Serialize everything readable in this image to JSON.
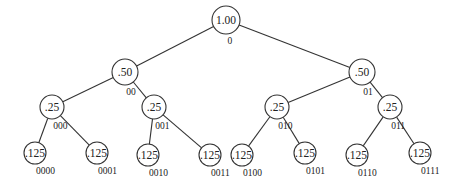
{
  "diagram": {
    "type": "binary-tree",
    "nodes": [
      {
        "id": "n",
        "value": "1.00",
        "code": "0",
        "x": 226,
        "y": 20,
        "r": 14
      },
      {
        "id": "n0",
        "value": ".50",
        "code": "00",
        "x": 125,
        "y": 72,
        "r": 13
      },
      {
        "id": "n1",
        "value": ".50",
        "code": "01",
        "x": 362,
        "y": 72,
        "r": 13
      },
      {
        "id": "n00",
        "value": ".25",
        "code": "000",
        "x": 52,
        "y": 107,
        "r": 12
      },
      {
        "id": "n01",
        "value": ".25",
        "code": "001",
        "x": 154,
        "y": 107,
        "r": 12
      },
      {
        "id": "n10",
        "value": ".25",
        "code": "010",
        "x": 277,
        "y": 107,
        "r": 12
      },
      {
        "id": "n11",
        "value": ".25",
        "code": "011",
        "x": 390,
        "y": 107,
        "r": 12
      },
      {
        "id": "n000",
        "value": ".125",
        "code": "0000",
        "x": 35,
        "y": 153,
        "r": 11
      },
      {
        "id": "n001",
        "value": ".125",
        "code": "0001",
        "x": 97,
        "y": 153,
        "r": 11
      },
      {
        "id": "n010",
        "value": ".125",
        "code": "0010",
        "x": 148,
        "y": 155,
        "r": 11
      },
      {
        "id": "n011",
        "value": ".125",
        "code": "0011",
        "x": 210,
        "y": 155,
        "r": 11
      },
      {
        "id": "n100",
        "value": ".125",
        "code": "0100",
        "x": 242,
        "y": 155,
        "r": 11
      },
      {
        "id": "n101",
        "value": ".125",
        "code": "0101",
        "x": 305,
        "y": 153,
        "r": 11
      },
      {
        "id": "n110",
        "value": ".125",
        "code": "0110",
        "x": 357,
        "y": 155,
        "r": 11
      },
      {
        "id": "n111",
        "value": ".125",
        "code": "0111",
        "x": 420,
        "y": 153,
        "r": 11
      }
    ],
    "edges": [
      [
        "n",
        "n0"
      ],
      [
        "n",
        "n1"
      ],
      [
        "n0",
        "n00"
      ],
      [
        "n0",
        "n01"
      ],
      [
        "n1",
        "n10"
      ],
      [
        "n1",
        "n11"
      ],
      [
        "n00",
        "n000"
      ],
      [
        "n00",
        "n001"
      ],
      [
        "n01",
        "n010"
      ],
      [
        "n01",
        "n011"
      ],
      [
        "n10",
        "n100"
      ],
      [
        "n10",
        "n101"
      ],
      [
        "n11",
        "n110"
      ],
      [
        "n11",
        "n111"
      ]
    ]
  }
}
